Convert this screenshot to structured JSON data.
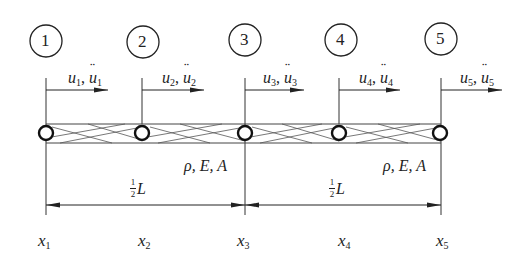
{
  "diagram": {
    "nodes": [
      {
        "id": "1",
        "x_label": "x",
        "x_sub": "1",
        "u_label": "u",
        "u_sub": "1",
        "a_label": "u",
        "a_sub": "1"
      },
      {
        "id": "2",
        "x_label": "x",
        "x_sub": "2",
        "u_label": "u",
        "u_sub": "2",
        "a_label": "u",
        "a_sub": "2"
      },
      {
        "id": "3",
        "x_label": "x",
        "x_sub": "3",
        "u_label": "u",
        "u_sub": "3",
        "a_label": "u",
        "a_sub": "3"
      },
      {
        "id": "4",
        "x_label": "x",
        "x_sub": "4",
        "u_label": "u",
        "u_sub": "4",
        "a_label": "u",
        "a_sub": "4"
      },
      {
        "id": "5",
        "x_label": "x",
        "x_sub": "5",
        "u_label": "u",
        "u_sub": "5",
        "a_label": "u",
        "a_sub": "5"
      }
    ],
    "properties": [
      {
        "text": "ρ, E, A"
      },
      {
        "text": "ρ, E, A"
      }
    ],
    "dimensions": [
      {
        "num": "1",
        "den": "2",
        "symbol": "L"
      },
      {
        "num": "1",
        "den": "2",
        "symbol": "L"
      }
    ],
    "separator": ","
  },
  "colors": {
    "line": "#333333",
    "text": "#222222",
    "background": "#ffffff"
  }
}
